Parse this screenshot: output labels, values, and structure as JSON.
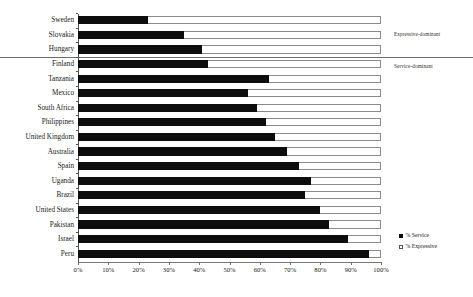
{
  "annotations": {
    "expressive_dominant": "Expressive-dominant",
    "service_dominant": "Service-dominant"
  },
  "legend": {
    "items": [
      {
        "label": "% Service",
        "swatch": "filled-square-icon",
        "color": "#0d0d0d"
      },
      {
        "label": "% Expressive",
        "swatch": "hollow-square-icon",
        "color": "#ffffff"
      }
    ]
  },
  "chart_data": {
    "type": "bar",
    "orientation": "horizontal",
    "stacked": true,
    "title": "",
    "xlabel": "",
    "ylabel": "",
    "xlim": [
      0,
      100
    ],
    "xticks": [
      "0%",
      "10%",
      "20%",
      "30%",
      "40%",
      "50%",
      "60%",
      "70%",
      "80%",
      "90%",
      "100%"
    ],
    "xtick_values": [
      0,
      10,
      20,
      30,
      40,
      50,
      60,
      70,
      80,
      90,
      100
    ],
    "grid": false,
    "legend_position": "bottom-right",
    "categories": [
      "Sweden",
      "Slovakia",
      "Hungary",
      "Finland",
      "Tanzania",
      "Mexico",
      "South Africa",
      "Philippines",
      "United Kingdom",
      "Australia",
      "Spain",
      "Uganda",
      "Brazil",
      "United States",
      "Pakistan",
      "Israel",
      "Peru"
    ],
    "series": [
      {
        "name": "% Service",
        "color": "#0d0d0d",
        "values": [
          23,
          35,
          41,
          43,
          63,
          56,
          59,
          62,
          65,
          69,
          73,
          77,
          75,
          80,
          83,
          89,
          96
        ]
      },
      {
        "name": "% Expressive",
        "color": "#ffffff",
        "values": [
          77,
          65,
          59,
          57,
          37,
          44,
          41,
          38,
          35,
          31,
          27,
          23,
          25,
          20,
          17,
          11,
          4
        ]
      }
    ],
    "group_divider": {
      "after_category": "Hungary",
      "above_label": "Expressive-dominant",
      "below_label": "Service-dominant"
    }
  }
}
